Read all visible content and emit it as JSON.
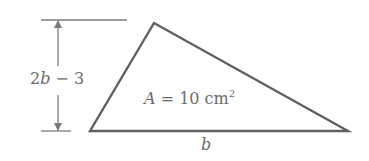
{
  "diagram": {
    "type": "triangle-with-dimensions",
    "height_label": {
      "var": "b",
      "prefix": "2",
      "operator": " − ",
      "constant": "3",
      "full": "2b − 3"
    },
    "area_label": {
      "var": "A",
      "equals": " = 10 cm",
      "exponent": "2",
      "full": "A = 10 cm²"
    },
    "base_label": {
      "var": "b"
    },
    "colors": {
      "stroke": "#5f5f5f",
      "guide": "#7a7a7a",
      "text": "#6b6b6b",
      "background": "#ffffff"
    },
    "vertices": {
      "left": [
        90,
        131
      ],
      "top": [
        154,
        23
      ],
      "right": [
        348,
        131
      ]
    }
  }
}
